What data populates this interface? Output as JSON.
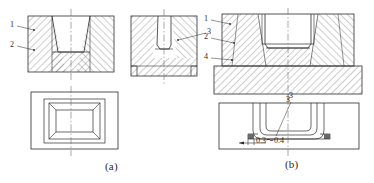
{
  "figure": {
    "background_color": "#ffffff",
    "line_color": "#2b2b2b",
    "hatch_color": "#555555",
    "center_line_color": "#707070"
  },
  "captions": [
    {
      "id": "a",
      "text": "(a)"
    },
    {
      "id": "b",
      "text": "(b)"
    }
  ],
  "panel_a": {
    "caption": "(a)",
    "views": [
      {
        "name": "front-section-left",
        "type": "section"
      },
      {
        "name": "front-section-right",
        "type": "section"
      },
      {
        "name": "plan-view",
        "type": "plan"
      }
    ],
    "labels": [
      {
        "id": "1",
        "text": "1"
      },
      {
        "id": "2",
        "text": "2"
      },
      {
        "id": "3",
        "text": "3"
      }
    ]
  },
  "panel_b": {
    "caption": "(b)",
    "views": [
      {
        "name": "front-section",
        "type": "section"
      },
      {
        "name": "plan-view",
        "type": "plan"
      }
    ],
    "labels": [
      {
        "id": "1",
        "text": "1"
      },
      {
        "id": "2",
        "text": "2"
      },
      {
        "id": "4",
        "text": "4"
      },
      {
        "id": "3-bottom",
        "text": "3"
      },
      {
        "id": "3-plan",
        "text": "3"
      }
    ],
    "dimension": {
      "text": "0.3～0.4",
      "name": "clearance-dimension"
    }
  }
}
